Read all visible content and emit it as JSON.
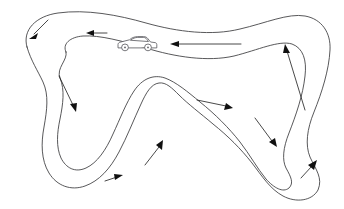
{
  "diagram": {
    "title": "Race Track Circuit Layout",
    "type": "race-track-map",
    "canvas": {
      "width": 344,
      "height": 209
    },
    "colors": {
      "background": "#ffffff",
      "track_edge": "#3a3a3c",
      "arrow": "#101010",
      "car_outline": "#55555a",
      "car_fill": "#ffffff"
    },
    "direction_of_travel": "counter-clockwise",
    "track": {
      "outer_edge_label": "outer track boundary",
      "inner_edge_label": "inner track boundary",
      "outer_path": "M 27 47 C 22 30, 36 16, 58 13 C 86 9, 118 15, 146 23 C 178 32, 212 36, 240 29 C 266 23, 288 13, 305 16 C 322 19, 331 33, 330 50 C 329 70, 322 92, 314 112 C 307 129, 305 145, 310 157 C 316 170, 323 178, 318 190 C 312 201, 296 203, 283 196 C 270 189, 262 176, 252 163 C 241 149, 228 136, 213 124 C 200 113, 188 104, 179 95 C 172 88, 166 82, 159 83 C 151 84, 146 93, 141 104 C 134 119, 127 137, 119 152 C 110 169, 99 181, 85 186 C 71 191, 57 186, 49 173 C 41 160, 41 143, 44 127 C 47 110, 49 95, 43 82 C 38 71, 31 61, 27 47 Z",
      "inner_path": "M 66 52 C 62 44, 70 37, 83 36 C 100 35, 122 41, 146 48 C 175 57, 208 62, 234 56 C 258 50, 279 40, 292 44 C 303 48, 307 60, 305 76 C 303 95, 296 115, 289 133 C 283 148, 282 160, 286 168 C 291 177, 294 183, 289 188 C 283 193, 274 188, 266 179 C 257 168, 250 155, 240 142 C 229 128, 215 114, 200 102 C 188 92, 176 82, 165 78 C 153 74, 142 79, 134 91 C 126 103, 120 119, 113 134 C 106 150, 97 163, 86 168 C 75 173, 66 168, 61 158 C 56 147, 57 133, 60 119 C 63 104, 65 90, 60 78 C 56 68, 68 60, 66 52 Z"
    },
    "car_marker": {
      "name": "race-car",
      "label": "Race car on upper straight",
      "position": {
        "x": 137,
        "y": 44
      },
      "heading": "left",
      "wheels": 2
    },
    "arrows": [
      {
        "id": "arrow-top-left-hairpin",
        "label": "down-left into left hairpin",
        "from": [
          48,
          20
        ],
        "to": [
          31,
          37
        ]
      },
      {
        "id": "arrow-top-straight-left",
        "label": "leftward on upper-left straight",
        "from": [
          107,
          33
        ],
        "to": [
          88,
          33
        ]
      },
      {
        "id": "arrow-top-straight-long",
        "label": "long leftward on upper straight",
        "from": [
          241,
          44
        ],
        "to": [
          172,
          44
        ]
      },
      {
        "id": "arrow-right-uphill",
        "label": "upward on right-hand straight",
        "from": [
          305,
          110
        ],
        "to": [
          285,
          45
        ]
      },
      {
        "id": "arrow-left-descent",
        "label": "down-right on left descent",
        "from": [
          59,
          76
        ],
        "to": [
          75,
          110
        ]
      },
      {
        "id": "arrow-center-hump",
        "label": "rightward over centre crest",
        "from": [
          197,
          100
        ],
        "to": [
          232,
          108
        ]
      },
      {
        "id": "arrow-center-climb",
        "label": "up-right approaching centre crest",
        "from": [
          145,
          165
        ],
        "to": [
          162,
          142
        ]
      },
      {
        "id": "arrow-bottom-valley",
        "label": "rightward through bottom valley",
        "from": [
          105,
          181
        ],
        "to": [
          120,
          176
        ]
      },
      {
        "id": "arrow-right-descent",
        "label": "down-right toward final hairpin",
        "from": [
          255,
          118
        ],
        "to": [
          276,
          146
        ]
      },
      {
        "id": "arrow-final-hairpin",
        "label": "up-right exiting final hairpin",
        "from": [
          301,
          178
        ],
        "to": [
          315,
          162
        ]
      }
    ]
  }
}
